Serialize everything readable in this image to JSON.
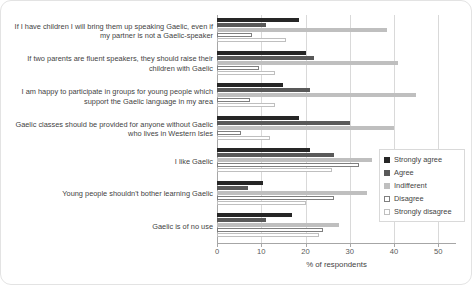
{
  "chart_data": {
    "type": "bar",
    "orientation": "horizontal",
    "title": "",
    "xlabel": "% of respondents",
    "ylabel": "",
    "xlim": [
      0,
      54
    ],
    "xticks": [
      0,
      10,
      20,
      30,
      40,
      50
    ],
    "grid": true,
    "legend_position": "right-middle",
    "categories": [
      "If I have children I will bring them up speaking Gaelic, even if my partner is not a Gaelic-speaker",
      "If two parents are fluent speakers, they should raise their children with Gaelic",
      "I am happy to participate in groups for young people which support the Gaelic language in my area",
      "Gaelic classes should be provided for anyone without Gaelic who lives in Western Isles",
      "I like Gaelic",
      "Young people shouldn't bother learning Gaelic",
      "Gaelic is of no use"
    ],
    "series": [
      {
        "name": "Strongly agree",
        "color": "#262626",
        "values": [
          18.5,
          20.0,
          15.0,
          18.5,
          21.0,
          10.5,
          17.0
        ]
      },
      {
        "name": "Agree",
        "color": "#595959",
        "values": [
          11.0,
          22.0,
          21.0,
          30.0,
          26.5,
          7.0,
          11.0
        ]
      },
      {
        "name": "Indifferent",
        "color": "#bfbfbf",
        "values": [
          38.5,
          41.0,
          45.0,
          40.0,
          35.0,
          34.0,
          27.5
        ]
      },
      {
        "name": "Disagree",
        "color": "#ffffff",
        "values": [
          8.0,
          9.5,
          7.5,
          5.5,
          32.0,
          26.5,
          24.0
        ]
      },
      {
        "name": "Strongly disagree",
        "color": "#ffffff",
        "values": [
          15.5,
          13.0,
          13.0,
          12.0,
          26.0,
          20.0,
          23.0
        ]
      }
    ]
  },
  "axis": {
    "x_title": "% of respondents",
    "x_tick_labels": [
      "0",
      "10",
      "20",
      "30",
      "40",
      "50"
    ]
  },
  "legend": {
    "items": [
      {
        "label": "Strongly agree"
      },
      {
        "label": "Agree"
      },
      {
        "label": "Indifferent"
      },
      {
        "label": "Disagree"
      },
      {
        "label": "Strongly disagree"
      }
    ]
  }
}
